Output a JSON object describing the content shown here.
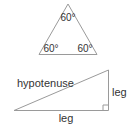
{
  "equilateral_triangle": {
    "angles": [
      "60°",
      "60°",
      "60°"
    ]
  },
  "right_triangle": {
    "hypotenuse_label": "hypotenuse",
    "vertical_leg_label": "leg",
    "horizontal_leg_label": "leg",
    "right_angle_marker": true
  },
  "colors": {
    "line": "#9a9a9a",
    "text": "#333333"
  }
}
